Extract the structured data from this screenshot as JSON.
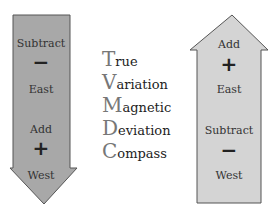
{
  "left_arrow": {
    "direction": "down",
    "color": "#a8a8a8",
    "labels": [
      "Subtract",
      "−",
      "East",
      "Add",
      "+",
      "West"
    ]
  },
  "right_arrow": {
    "direction": "up",
    "color": "#d4d4d4",
    "labels": [
      "Add",
      "+",
      "East",
      "Subtract",
      "−",
      "West"
    ]
  },
  "mnemonic": [
    {
      "initial": "T",
      "rest": "rue"
    },
    {
      "initial": "V",
      "rest": "ariation"
    },
    {
      "initial": "M",
      "rest": "agnetic"
    },
    {
      "initial": "D",
      "rest": "eviation"
    },
    {
      "initial": "C",
      "rest": "ompass"
    }
  ]
}
